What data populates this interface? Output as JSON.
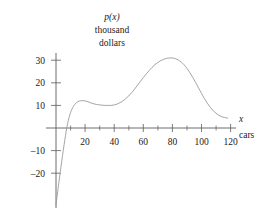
{
  "chart_data": {
    "type": "line",
    "title": "",
    "subtitle": "",
    "ylabel_lines": [
      "p(x)",
      "thousand",
      "dollars"
    ],
    "ylabel": "p(x) thousand dollars",
    "xlabel": "x cars",
    "xlabel_symbol": "x",
    "xlabel_unit": "cars",
    "xlim": [
      0,
      124
    ],
    "ylim": [
      -24,
      33
    ],
    "grid": false,
    "legend": null,
    "x_tick_labels": [
      "20",
      "40",
      "60",
      "80",
      "100",
      "120"
    ],
    "x_tick_values": [
      20,
      40,
      60,
      80,
      100,
      120
    ],
    "x_minor_tick_values": [
      10,
      30,
      50,
      70,
      90,
      110
    ],
    "y_tick_labels": [
      "30",
      "20",
      "10",
      "–10",
      "–20"
    ],
    "y_tick_values": [
      30,
      20,
      10,
      -10,
      -20
    ],
    "x": [
      0,
      2,
      4,
      6,
      8,
      10,
      12,
      14,
      16,
      18,
      20,
      22,
      24,
      26,
      28,
      30,
      32,
      34,
      36,
      38,
      40,
      42,
      44,
      46,
      48,
      50,
      52,
      54,
      56,
      58,
      60,
      62,
      64,
      66,
      68,
      70,
      72,
      74,
      76,
      78,
      80,
      82,
      84,
      86,
      88,
      90,
      92,
      94,
      96,
      98,
      100,
      102,
      104,
      106,
      108,
      110,
      112,
      114,
      116,
      118
    ],
    "values": [
      -34,
      -24,
      -14.5,
      -5.5,
      2.0,
      6.8,
      9.6,
      11.2,
      11.9,
      12.1,
      12.0,
      11.6,
      11.1,
      10.7,
      10.4,
      10.2,
      10.1,
      10.0,
      10.0,
      10.0,
      10.2,
      10.6,
      11.2,
      12.0,
      13.0,
      14.2,
      15.6,
      17.2,
      18.9,
      20.6,
      22.3,
      23.9,
      25.4,
      26.8,
      28.0,
      29.0,
      29.8,
      30.4,
      30.8,
      31.0,
      31.0,
      30.7,
      30.1,
      29.2,
      28.0,
      26.4,
      24.5,
      22.4,
      20.1,
      17.7,
      15.3,
      13.0,
      11.0,
      9.2,
      7.7,
      6.5,
      5.6,
      5.0,
      4.6,
      4.4
    ],
    "annotations": {
      "local_max": {
        "x": 19,
        "y": 12
      },
      "local_min": {
        "x": 37,
        "y": 10
      },
      "global_max": {
        "x": 80,
        "y": 31
      },
      "zero_crossing": {
        "x": 7,
        "y": 0
      }
    },
    "colors": {
      "curve": "#9a9a9a",
      "axis": "#5c5c5c",
      "text": "#1a1a1a",
      "background": "#ffffff"
    }
  }
}
